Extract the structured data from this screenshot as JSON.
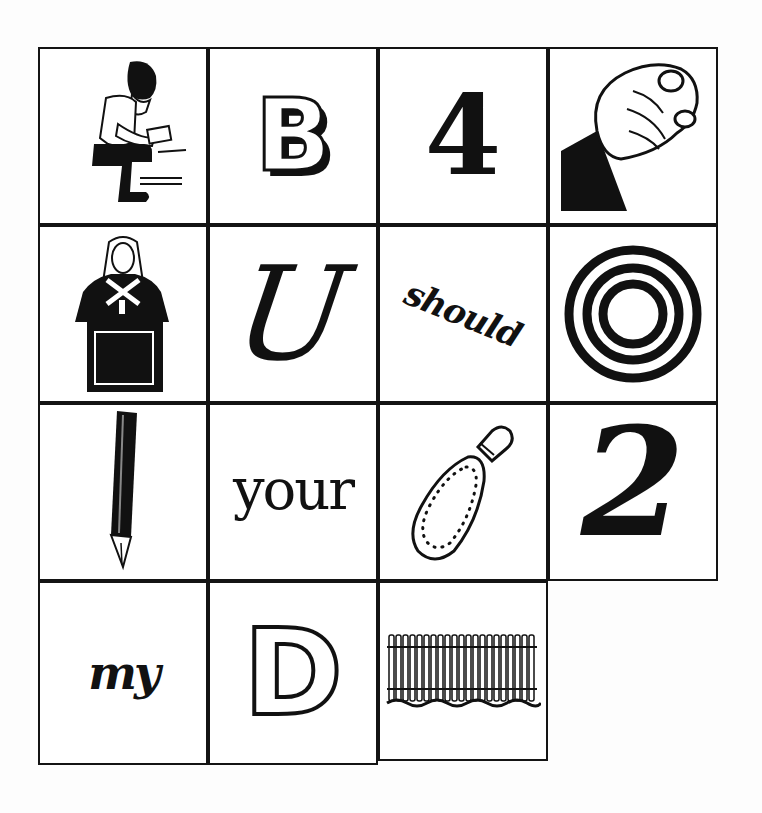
{
  "puzzle": {
    "type": "rebus",
    "cells": [
      {
        "row": 1,
        "col": 1,
        "kind": "picture",
        "icon": "boy-sitting-reading-icon",
        "label": "boy sitting reading a book"
      },
      {
        "row": 1,
        "col": 2,
        "kind": "text",
        "text": "B",
        "style": "3D block letter"
      },
      {
        "row": 1,
        "col": 3,
        "kind": "text",
        "text": "4",
        "style": "ornamental numeral"
      },
      {
        "row": 1,
        "col": 4,
        "kind": "picture",
        "icon": "fist-icon",
        "label": "clenched fist"
      },
      {
        "row": 2,
        "col": 1,
        "kind": "picture",
        "icon": "judge-at-bench-icon",
        "label": "judge with gavel at bench"
      },
      {
        "row": 2,
        "col": 2,
        "kind": "text",
        "text": "U",
        "style": "script"
      },
      {
        "row": 2,
        "col": 3,
        "kind": "text",
        "text": "should",
        "style": "handwritten, slanted"
      },
      {
        "row": 2,
        "col": 4,
        "kind": "picture",
        "icon": "concentric-rings-icon",
        "label": "concentric rings"
      },
      {
        "row": 3,
        "col": 1,
        "kind": "picture",
        "icon": "fountain-pen-icon",
        "label": "fountain pen"
      },
      {
        "row": 3,
        "col": 2,
        "kind": "text",
        "text": "your",
        "style": "serif"
      },
      {
        "row": 3,
        "col": 3,
        "kind": "picture",
        "icon": "shoe-sole-icon",
        "label": "shoe sole with stitching"
      },
      {
        "row": 3,
        "col": 4,
        "kind": "text",
        "text": "2",
        "style": "bold italic numeral"
      },
      {
        "row": 4,
        "col": 1,
        "kind": "text",
        "text": "my",
        "style": "bold script"
      },
      {
        "row": 4,
        "col": 2,
        "kind": "text",
        "text": "D",
        "style": "outlined ornamental letter"
      },
      {
        "row": 4,
        "col": 3,
        "kind": "picture",
        "icon": "picket-fence-icon",
        "label": "picket fence"
      }
    ]
  },
  "colors": {
    "ink": "#111111",
    "paper": "#ffffff",
    "background": "#fdfdfd"
  }
}
